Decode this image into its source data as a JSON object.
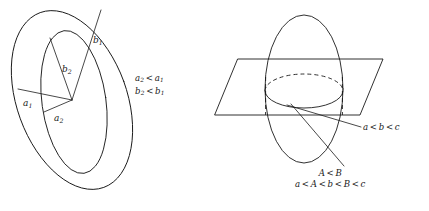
{
  "figure": {
    "background_color": "#ffffff",
    "ink_color": "#1a1a1a",
    "panels": [
      {
        "id": "left-panel",
        "name": "nested-ellipses-diagram",
        "description": "Two tilted nested ellipses sharing a common center with labeled semi-axis segments"
      },
      {
        "id": "right-panel",
        "name": "ellipsoid-plane-diagram",
        "description": "Ellipsoid cut by a plane, intersection circle shown with dashed hidden arc"
      }
    ]
  },
  "left_panel": {
    "axis_labels": {
      "b1": {
        "base": "b",
        "sub": "1",
        "x": 93,
        "y": 42
      },
      "b2": {
        "base": "b",
        "sub": "2",
        "x": 63,
        "y": 71
      },
      "a1": {
        "base": "a",
        "sub": "1",
        "x": 24,
        "y": 104
      },
      "a2": {
        "base": "a",
        "sub": "2",
        "x": 57,
        "y": 118
      }
    },
    "conditions": [
      {
        "lhs": "a",
        "lhs_sub": "2",
        "rel": "<",
        "rhs": "a",
        "rhs_sub": "1"
      },
      {
        "lhs": "b",
        "lhs_sub": "2",
        "rel": "<",
        "rhs": "b",
        "rhs_sub": "1"
      }
    ]
  },
  "right_panel": {
    "condition_abc": {
      "terms": [
        "a",
        "b",
        "c"
      ],
      "relations": [
        "<",
        "<"
      ]
    },
    "condition_AB": {
      "terms": [
        "A",
        "B"
      ],
      "relations": [
        "<"
      ]
    },
    "condition_aAbBc": {
      "terms": [
        "a",
        "A",
        "b",
        "B",
        "c"
      ],
      "relations": [
        "<",
        "<",
        "<",
        "<"
      ]
    }
  }
}
